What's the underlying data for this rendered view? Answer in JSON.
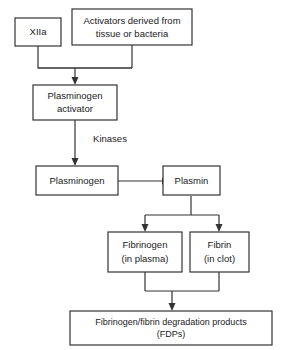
{
  "diagram": {
    "type": "flowchart",
    "colors": {
      "background": "#ffffff",
      "line": "#333333",
      "text": "#1a1a1a",
      "box_fill": "#ffffff"
    },
    "nodes": {
      "xiia": {
        "label": "XIIa"
      },
      "activators": {
        "line1": "Activators derived from",
        "line2": "tissue or bacteria"
      },
      "plasminogen_activator": {
        "line1": "Plasminogen",
        "line2": "activator"
      },
      "plasminogen": {
        "label": "Plasminogen"
      },
      "plasmin": {
        "label": "Plasmin"
      },
      "fibrinogen": {
        "line1": "Fibrinogen",
        "line2": "(in plasma)"
      },
      "fibrin": {
        "line1": "Fibrin",
        "line2": "(in clot)"
      },
      "fdps": {
        "line1": "Fibrinogen/fibrin degradation products",
        "line2": "(FDPs)"
      }
    },
    "edge_labels": {
      "kinases": "Kinases"
    }
  }
}
